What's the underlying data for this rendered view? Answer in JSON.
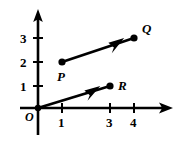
{
  "figure": {
    "background_color": "#ffffff",
    "stroke_color": "#000000"
  },
  "axes": {
    "origin_label": "O",
    "x_axis_name": "x-axis",
    "y_axis_name": "y-axis",
    "x_ticks": [
      {
        "label": "1",
        "value": 1
      },
      {
        "label": "3",
        "value": 3
      },
      {
        "label": "4",
        "value": 4
      }
    ],
    "y_ticks": [
      {
        "label": "1",
        "value": 1
      },
      {
        "label": "2",
        "value": 2
      },
      {
        "label": "3",
        "value": 3
      }
    ]
  },
  "points": {
    "P": {
      "label": "P",
      "x": 1,
      "y": 2
    },
    "Q": {
      "label": "Q",
      "x": 4,
      "y": 3
    },
    "R": {
      "label": "R",
      "x": 3,
      "y": 1
    }
  },
  "vectors": [
    {
      "name": "vector-PQ",
      "from": "P",
      "to": "Q"
    },
    {
      "name": "vector-OR",
      "from": "O",
      "to": "R"
    }
  ]
}
